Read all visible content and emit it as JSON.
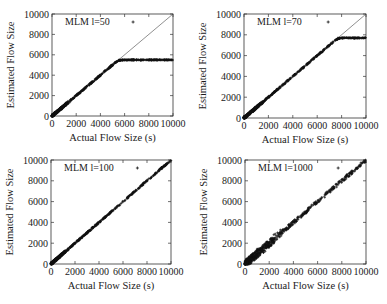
{
  "figure": {
    "xlabel": "Actual Flow Size (s)",
    "ylabel": "Estimated Flow Size"
  },
  "chart_data": [
    {
      "type": "scatter",
      "title": "",
      "legend": "MLM l=50",
      "legend_marker": "+",
      "xlabel": "Actual Flow Size (s)",
      "ylabel": "Estimated Flow Size",
      "xlim": [
        0,
        10000
      ],
      "ylim": [
        0,
        10000
      ],
      "xticks": [
        0,
        2000,
        4000,
        6000,
        8000,
        10000
      ],
      "yticks": [
        0,
        2000,
        4000,
        6000,
        8000,
        10000
      ],
      "reference_line": "y = x",
      "saturation": 5500,
      "x": [
        0,
        500,
        1000,
        2000,
        3000,
        4000,
        5000,
        5500,
        6000,
        7000,
        8000,
        9000,
        10000
      ],
      "y": [
        0,
        500,
        1000,
        2000,
        3000,
        4000,
        5000,
        5450,
        5500,
        5500,
        5500,
        5500,
        5500
      ],
      "outlier": {
        "x": 6700,
        "y": 10000
      }
    },
    {
      "type": "scatter",
      "title": "",
      "legend": "MLM l=70",
      "legend_marker": "+",
      "xlabel": "Actual Flow Size (s)",
      "ylabel": "Estimated Flow Size",
      "xlim": [
        0,
        10000
      ],
      "ylim": [
        0,
        10000
      ],
      "xticks": [
        0,
        2000,
        4000,
        6000,
        8000,
        10000
      ],
      "yticks": [
        0,
        2000,
        4000,
        6000,
        8000,
        10000
      ],
      "reference_line": "y = x",
      "saturation": 7700,
      "x": [
        0,
        500,
        1000,
        2000,
        3000,
        4000,
        5000,
        6000,
        7000,
        7500,
        8000,
        9000,
        10000
      ],
      "y": [
        0,
        500,
        1000,
        2000,
        3000,
        4000,
        5000,
        6000,
        7000,
        7400,
        7650,
        7700,
        7700
      ],
      "outlier": {
        "x": 6900,
        "y": 10000
      }
    },
    {
      "type": "scatter",
      "title": "",
      "legend": "MLM l=100",
      "legend_marker": "+",
      "xlabel": "Actual Flow Size (s)",
      "ylabel": "Estimated Flow Size",
      "xlim": [
        0,
        10000
      ],
      "ylim": [
        0,
        10000
      ],
      "xticks": [
        0,
        2000,
        4000,
        6000,
        8000,
        10000
      ],
      "yticks": [
        0,
        2000,
        4000,
        6000,
        8000,
        10000
      ],
      "reference_line": "y = x",
      "x": [
        0,
        500,
        1000,
        2000,
        3000,
        4000,
        5000,
        6000,
        7000,
        8000,
        9000,
        10000
      ],
      "y": [
        0,
        500,
        1000,
        2000,
        3000,
        4000,
        5000,
        6000,
        7000,
        8000,
        9000,
        9900
      ],
      "outlier": {
        "x": 7200,
        "y": 10000
      }
    },
    {
      "type": "scatter",
      "title": "",
      "legend": "MLM l=1000",
      "legend_marker": "+",
      "xlabel": "Actual Flow Size (s)",
      "ylabel": "Estimated Flow Size",
      "xlim": [
        0,
        10000
      ],
      "ylim": [
        0,
        10000
      ],
      "xticks": [
        0,
        2000,
        4000,
        6000,
        8000,
        10000
      ],
      "yticks": [
        0,
        2000,
        4000,
        6000,
        8000,
        10000
      ],
      "reference_line": "y = x",
      "x": [
        0,
        500,
        1000,
        2000,
        3000,
        4000,
        5000,
        6000,
        7000,
        8000,
        9000,
        10000
      ],
      "y": [
        0,
        500,
        1000,
        2000,
        3000,
        4000,
        5000,
        6000,
        7000,
        8000,
        9000,
        9900
      ],
      "spread": "wide at low x (0-3000), narrower at high x",
      "outlier": {
        "x": 7700,
        "y": 10000
      }
    }
  ]
}
